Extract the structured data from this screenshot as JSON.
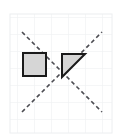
{
  "figure": {
    "canvas": {
      "width": 124,
      "height": 137,
      "background_color": "#ffffff"
    },
    "grid": {
      "name": "graph-paper-grid",
      "visible": true,
      "origin_x": 10,
      "origin_y": 14,
      "cell_size": 17,
      "columns": 6,
      "rows": 7,
      "line_color": "#eceef0",
      "line_width": 1
    },
    "axes": [
      {
        "name": "dashed-axis-descending",
        "label": "",
        "x1": 22,
        "y1": 32,
        "x2": 102,
        "y2": 112,
        "color": "#4c4c52",
        "width": 1.6,
        "dash": "4 3"
      },
      {
        "name": "dashed-axis-ascending",
        "label": "",
        "x1": 22,
        "y1": 112,
        "x2": 102,
        "y2": 32,
        "color": "#4c4c52",
        "width": 1.6,
        "dash": "4 3"
      }
    ],
    "shapes": [
      {
        "name": "gray-square",
        "type": "square",
        "label": "",
        "x": 23,
        "y": 53,
        "width": 23,
        "height": 23,
        "fill_color": "#d6d6d6",
        "stroke_color": "#1a1a1a",
        "stroke_width": 2
      },
      {
        "name": "gray-right-triangle",
        "type": "right-triangle",
        "label": "",
        "points": "62,54 85,54 62,77",
        "fill_color": "#d6d6d6",
        "stroke_color": "#1a1a1a",
        "stroke_width": 2,
        "right_angle_vertex": "top-left",
        "hypotenuse": "bottom-left to top-right"
      }
    ],
    "colors": {
      "shape_fill": "#d6d6d6",
      "shape_stroke": "#1a1a1a",
      "axis_line": "#4c4c52",
      "grid_line": "#eceef0",
      "background": "#ffffff"
    }
  }
}
